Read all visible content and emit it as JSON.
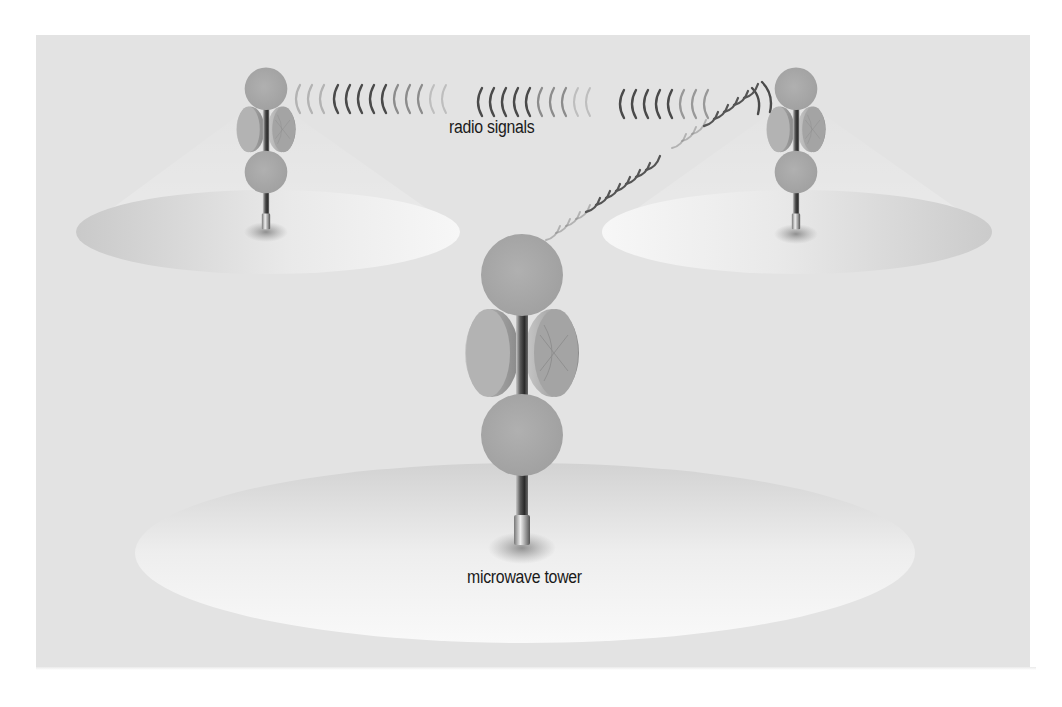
{
  "diagram": {
    "type": "network-illustration",
    "labels": {
      "signals": "radio signals",
      "tower": "microwave tower"
    },
    "towers": [
      {
        "id": "left",
        "x": 266,
        "top": 70,
        "base_y": 230,
        "scale": 0.55
      },
      {
        "id": "right",
        "x": 796,
        "top": 70,
        "base_y": 232,
        "scale": 0.55
      },
      {
        "id": "center",
        "x": 520,
        "top": 235,
        "base_y": 550,
        "scale": 1.0
      }
    ],
    "coverage_areas": [
      {
        "id": "left",
        "cx": 268,
        "cy": 232,
        "rx": 192,
        "ry": 42
      },
      {
        "id": "right",
        "cx": 797,
        "cy": 232,
        "rx": 195,
        "ry": 42
      },
      {
        "id": "center",
        "cx": 525,
        "cy": 553,
        "rx": 390,
        "ry": 90
      }
    ],
    "colors": {
      "panel": "#e3e3e3",
      "ellipse_light": "#f4f4f4",
      "ellipse_dark": "#cfcfcf",
      "antenna": "#a9a9a9",
      "mast_dark": "#3a3a3a",
      "signal_arc": "#555555",
      "text": "#1a1a1a"
    }
  }
}
